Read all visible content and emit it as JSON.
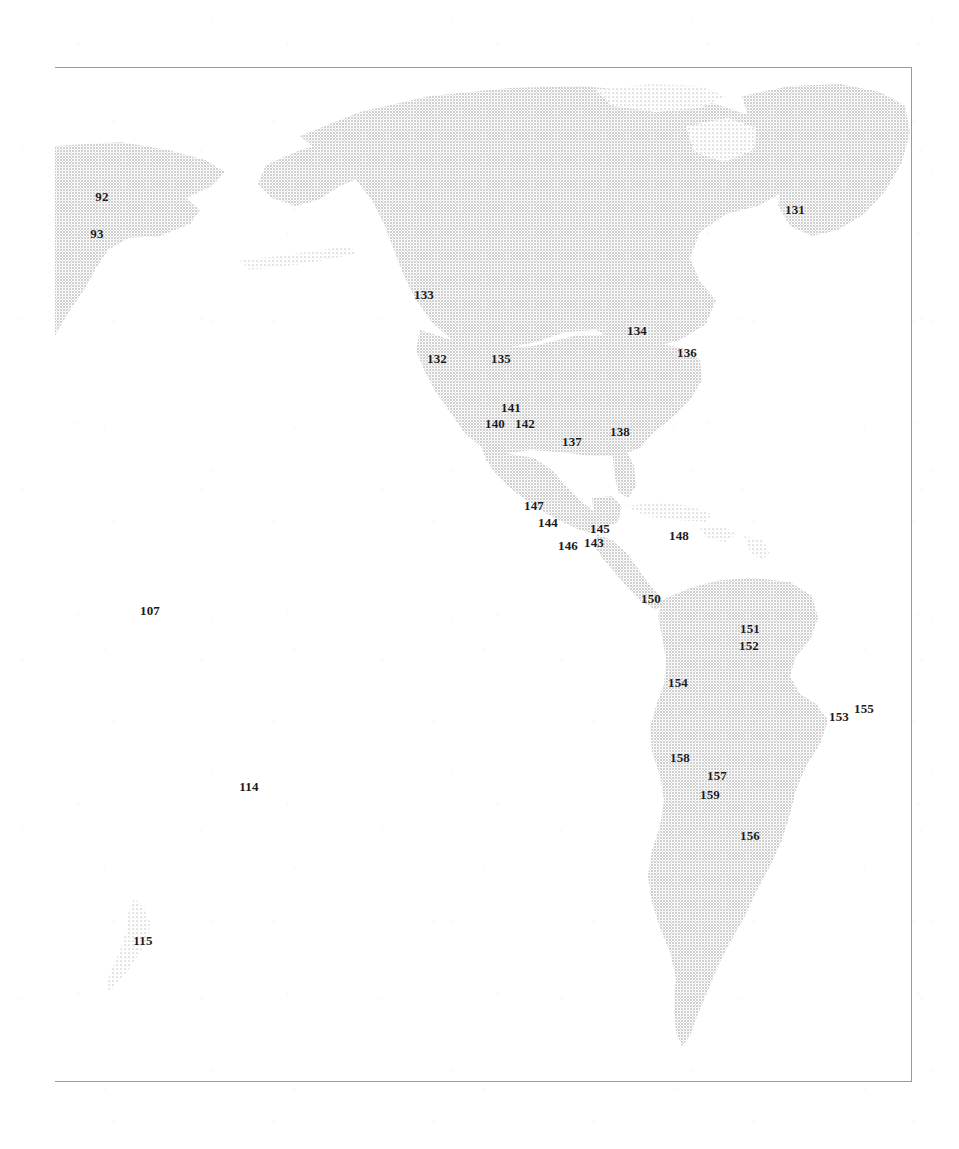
{
  "figure": {
    "kind": "scanned-map-figure",
    "region": "Western Hemisphere",
    "background_color": "#ffffff",
    "frame_color": "#9a9a9a",
    "land_fill_color": "#dcdcdc",
    "label_color": "#1b1b1b"
  },
  "map": {
    "frame": {
      "left": 55,
      "top": 67,
      "width": 857,
      "height": 1015
    },
    "landmasses": [
      {
        "name": "siberia-northeast-asia"
      },
      {
        "name": "alaska"
      },
      {
        "name": "canada"
      },
      {
        "name": "greenland"
      },
      {
        "name": "united-states"
      },
      {
        "name": "mexico"
      },
      {
        "name": "central-america"
      },
      {
        "name": "caribbean-islands"
      },
      {
        "name": "south-america"
      },
      {
        "name": "new-zealand"
      }
    ],
    "site_labels": [
      {
        "id": "92",
        "text": "92",
        "x": 102,
        "y": 196
      },
      {
        "id": "93",
        "text": "93",
        "x": 97,
        "y": 233
      },
      {
        "id": "131",
        "text": "131",
        "x": 795,
        "y": 209
      },
      {
        "id": "133",
        "text": "133",
        "x": 424,
        "y": 294
      },
      {
        "id": "134",
        "text": "134",
        "x": 637,
        "y": 330
      },
      {
        "id": "132",
        "text": "132",
        "x": 437,
        "y": 358
      },
      {
        "id": "135",
        "text": "135",
        "x": 501,
        "y": 358
      },
      {
        "id": "136",
        "text": "136",
        "x": 687,
        "y": 352
      },
      {
        "id": "141",
        "text": "141",
        "x": 511,
        "y": 407
      },
      {
        "id": "140",
        "text": "140",
        "x": 495,
        "y": 423
      },
      {
        "id": "142",
        "text": "142",
        "x": 525,
        "y": 423
      },
      {
        "id": "138",
        "text": "138",
        "x": 620,
        "y": 431
      },
      {
        "id": "137",
        "text": "137",
        "x": 572,
        "y": 441
      },
      {
        "id": "147",
        "text": "147",
        "x": 534,
        "y": 505
      },
      {
        "id": "144",
        "text": "144",
        "x": 548,
        "y": 522
      },
      {
        "id": "145",
        "text": "145",
        "x": 600,
        "y": 528
      },
      {
        "id": "148",
        "text": "148",
        "x": 679,
        "y": 535
      },
      {
        "id": "146",
        "text": "146",
        "x": 568,
        "y": 545
      },
      {
        "id": "143",
        "text": "143",
        "x": 594,
        "y": 542
      },
      {
        "id": "150",
        "text": "150",
        "x": 651,
        "y": 598
      },
      {
        "id": "107",
        "text": "107",
        "x": 150,
        "y": 610
      },
      {
        "id": "151",
        "text": "151",
        "x": 750,
        "y": 628
      },
      {
        "id": "152",
        "text": "152",
        "x": 749,
        "y": 645
      },
      {
        "id": "154",
        "text": "154",
        "x": 678,
        "y": 682
      },
      {
        "id": "153",
        "text": "153",
        "x": 839,
        "y": 716
      },
      {
        "id": "155",
        "text": "155",
        "x": 864,
        "y": 708
      },
      {
        "id": "158",
        "text": "158",
        "x": 680,
        "y": 757
      },
      {
        "id": "157",
        "text": "157",
        "x": 717,
        "y": 775
      },
      {
        "id": "114",
        "text": "114",
        "x": 249,
        "y": 786
      },
      {
        "id": "159",
        "text": "159",
        "x": 710,
        "y": 794
      },
      {
        "id": "156",
        "text": "156",
        "x": 750,
        "y": 835
      },
      {
        "id": "115",
        "text": "115",
        "x": 143,
        "y": 940
      }
    ]
  }
}
